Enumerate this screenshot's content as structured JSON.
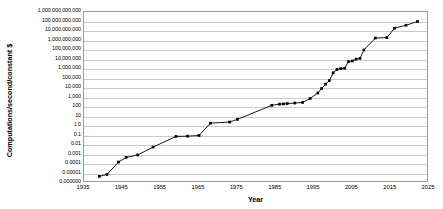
{
  "chart_data": {
    "type": "line",
    "title": "",
    "xlabel": "Year",
    "ylabel": "Computations/second/constant $",
    "xlim": [
      1935,
      2025
    ],
    "ylim": [
      1e-06,
      1000000000000
    ],
    "yscale": "log",
    "grid": true,
    "legend": "none",
    "xtick_labels": [
      "1935",
      "1945",
      "1955",
      "1965",
      "1975",
      "1985",
      "1995",
      "2005",
      "2015",
      "2025"
    ],
    "xtick_values": [
      1935,
      1945,
      1955,
      1965,
      1975,
      1985,
      1995,
      2005,
      2015,
      2025
    ],
    "ytick_labels": [
      "1,000,000,000,000",
      "100,000,000,000",
      "10,000,000,000",
      "1,000,000,000",
      "100,000,000",
      "10,000,000",
      "1,000,000",
      "100,000",
      "10,000",
      "1,000",
      "100",
      "10",
      "1.0",
      "0.1",
      "0.01",
      "0.001",
      "0.0001",
      "0.00001",
      "0.000000"
    ],
    "ytick_values": [
      1000000000000,
      100000000000,
      10000000000,
      1000000000,
      100000000,
      10000000,
      1000000,
      100000,
      10000,
      1000,
      100,
      10,
      1,
      0.1,
      0.01,
      0.001,
      0.0001,
      1e-05,
      1e-06
    ],
    "series": [
      {
        "name": "Computations per second per constant dollar",
        "color": "#000000",
        "marker": "square",
        "x": [
          1939,
          1941,
          1944,
          1946,
          1949,
          1953,
          1959,
          1962,
          1965,
          1968,
          1973,
          1975,
          1984,
          1986,
          1987,
          1988,
          1990,
          1992,
          1994,
          1996,
          1997,
          1998,
          1999,
          2000,
          2001,
          2002,
          2003,
          2004,
          2005,
          2006,
          2007,
          2008,
          2011,
          2014,
          2016,
          2019,
          2022
        ],
        "y": [
          5e-06,
          8e-06,
          0.00016,
          0.0005,
          0.0009,
          0.006,
          0.08,
          0.085,
          0.1,
          2.0,
          2.6,
          5.0,
          150,
          200,
          210,
          230,
          260,
          300,
          800,
          3000,
          9000,
          25000,
          60000,
          400000,
          900000,
          1100000,
          1200000,
          6000000,
          7000000,
          11000000,
          13000000,
          100000000,
          1800000000,
          2000000000,
          20000000000,
          40000000000,
          100000000000
        ]
      }
    ]
  },
  "axis": {
    "x_title": "Year",
    "y_title": "Computations/second/constant $"
  }
}
